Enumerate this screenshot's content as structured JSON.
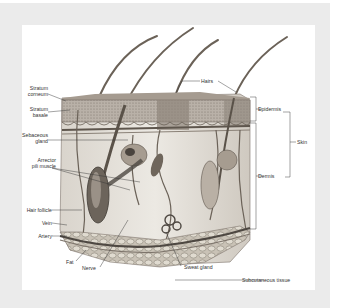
{
  "figure": {
    "background_color": "#ebebeb",
    "card_color": "#ffffff"
  },
  "labels": {
    "hairs": "Hairs",
    "stratum_corneum_1": "Stratum",
    "stratum_corneum_2": "corneum",
    "stratum_basale_1": "Stratum",
    "stratum_basale_2": "basale",
    "sebaceous_gland_1": "Sebaceous",
    "sebaceous_gland_2": "gland",
    "arrector_pili_1": "Arrector",
    "arrector_pili_2": "pili muscle",
    "hair_follicle": "Hair follicle",
    "vein": "Vein",
    "artery": "Artery",
    "fat": "Fat",
    "nerve": "Nerve",
    "sweat_gland": "Sweat gland",
    "subcutaneous_tissue": "Subcutaneous tissue",
    "epidermis": "Epidermis",
    "dermis": "Dermis",
    "skin": "Skin"
  }
}
